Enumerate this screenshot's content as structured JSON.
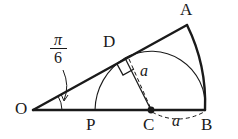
{
  "figure": {
    "background_color": "#ffffff",
    "stroke_color": "#1a1a1a",
    "points": [
      {
        "name": "O",
        "label": "O",
        "x": 33,
        "y": 110,
        "label_x": 15,
        "label_y": 101
      },
      {
        "name": "A",
        "label": "A",
        "x": 187,
        "y": 25,
        "label_x": 180,
        "label_y": 2
      },
      {
        "name": "B",
        "label": "B",
        "x": 205,
        "y": 110,
        "label_x": 201,
        "label_y": 115
      },
      {
        "name": "C",
        "label": "C",
        "x": 151,
        "y": 110,
        "label_x": 144,
        "label_y": 115
      },
      {
        "name": "D",
        "label": "D",
        "x": 125,
        "y": 58,
        "label_x": 103,
        "label_y": 35
      },
      {
        "name": "P",
        "label": "P",
        "x": 95,
        "y": 110,
        "label_x": 87,
        "label_y": 115
      }
    ],
    "angle": {
      "name": "angle-AOB",
      "numerator": "π",
      "denominator": "6",
      "vertex": "O"
    },
    "lengths": [
      {
        "name": "radius-CD",
        "label": "a",
        "x": 141,
        "y": 64
      },
      {
        "name": "radius-CB",
        "label": "a",
        "x": 173,
        "y": 113
      }
    ],
    "marks": {
      "right_angle_at": "D",
      "center_dot_at": "C"
    }
  }
}
